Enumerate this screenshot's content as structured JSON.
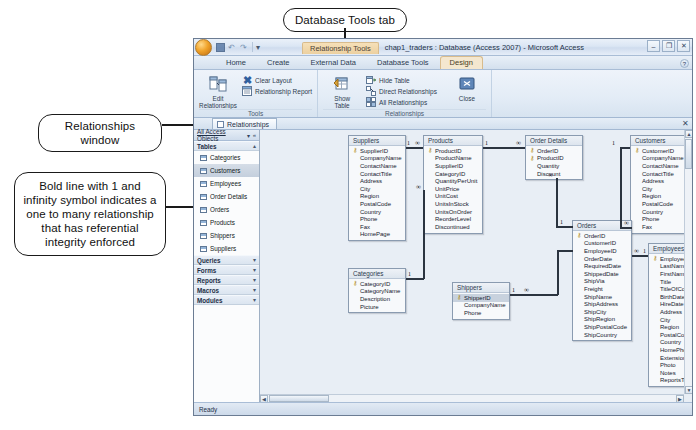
{
  "annotations": [
    {
      "id": "tab-callout",
      "text": "Database Tools tab"
    },
    {
      "id": "window-callout",
      "text": "Relationships window"
    },
    {
      "id": "boldline-callout",
      "text": "Bold line with 1 and infinity symbol indicates a one to many relationship that has referential integrity enforced"
    }
  ],
  "window": {
    "context_tools_label": "Relationship Tools",
    "document_title": "chap1_traders : Database (Access 2007) - Microsoft Access",
    "quick_access": {
      "save_icon": "save-icon",
      "undo_icon": "undo-icon",
      "redo_icon": "redo-icon",
      "customize_icon": "chevron-down-icon"
    },
    "controls": {
      "minimize": "–",
      "restore": "❐",
      "close": "✕"
    },
    "help_icon": "help-icon"
  },
  "ribbon": {
    "tabs": [
      {
        "label": "Home",
        "active": false,
        "contextual": false
      },
      {
        "label": "Create",
        "active": false,
        "contextual": false
      },
      {
        "label": "External Data",
        "active": false,
        "contextual": false
      },
      {
        "label": "Database Tools",
        "active": false,
        "contextual": false
      },
      {
        "label": "Design",
        "active": true,
        "contextual": true
      }
    ],
    "groups": [
      {
        "name": "Tools",
        "big_buttons": [
          {
            "label": "Edit\nRelationships",
            "icon": "edit-relationships-icon"
          }
        ],
        "small_buttons": [
          {
            "label": "Clear Layout",
            "icon": "clear-layout-icon"
          },
          {
            "label": "Relationship Report",
            "icon": "relationship-report-icon"
          }
        ]
      },
      {
        "name": "Relationships",
        "big_buttons": [
          {
            "label": "Show\nTable",
            "icon": "show-table-icon"
          }
        ],
        "small_buttons": [
          {
            "label": "Hide Table",
            "icon": "hide-table-icon"
          },
          {
            "label": "Direct Relationships",
            "icon": "direct-relationships-icon"
          },
          {
            "label": "All Relationships",
            "icon": "all-relationships-icon"
          }
        ],
        "close_button": {
          "label": "Close",
          "icon": "close-relationships-icon"
        }
      }
    ]
  },
  "document_tab": {
    "label": "Relationships",
    "icon": "relationships-tab-icon",
    "close_icon": "close-icon"
  },
  "nav_pane": {
    "header": {
      "title": "All Access Objects",
      "dropdown_icon": "chevron-down-icon",
      "shutter_icon": "shutter-bar-icon"
    },
    "groups": [
      {
        "label": "Tables",
        "collapse_icon": "chevron-up-icon",
        "items": [
          {
            "label": "Categories",
            "selected": false
          },
          {
            "label": "Customers",
            "selected": true
          },
          {
            "label": "Employees",
            "selected": false
          },
          {
            "label": "Order Details",
            "selected": false
          },
          {
            "label": "Orders",
            "selected": false
          },
          {
            "label": "Products",
            "selected": false
          },
          {
            "label": "Shippers",
            "selected": false
          },
          {
            "label": "Suppliers",
            "selected": false
          }
        ]
      },
      {
        "label": "Queries",
        "collapse_icon": "chevron-down-icon",
        "items": []
      },
      {
        "label": "Forms",
        "collapse_icon": "chevron-down-icon",
        "items": []
      },
      {
        "label": "Reports",
        "collapse_icon": "chevron-down-icon",
        "items": []
      },
      {
        "label": "Macros",
        "collapse_icon": "chevron-down-icon",
        "items": []
      },
      {
        "label": "Modules",
        "collapse_icon": "chevron-down-icon",
        "items": []
      }
    ]
  },
  "relationships": {
    "tables": [
      {
        "name": "Suppliers",
        "x": 88,
        "y": 5,
        "w": 58,
        "fields": [
          {
            "name": "SupplierID",
            "key": true
          },
          {
            "name": "CompanyName",
            "key": false
          },
          {
            "name": "ContactName",
            "key": false
          },
          {
            "name": "ContactTitle",
            "key": false
          },
          {
            "name": "Address",
            "key": false
          },
          {
            "name": "City",
            "key": false
          },
          {
            "name": "Region",
            "key": false
          },
          {
            "name": "PostalCode",
            "key": false
          },
          {
            "name": "Country",
            "key": false
          },
          {
            "name": "Phone",
            "key": false
          },
          {
            "name": "Fax",
            "key": false
          },
          {
            "name": "HomePage",
            "key": false
          }
        ]
      },
      {
        "name": "Products",
        "x": 163,
        "y": 5,
        "w": 60,
        "fields": [
          {
            "name": "ProductID",
            "key": true
          },
          {
            "name": "ProductName",
            "key": false
          },
          {
            "name": "SupplierID",
            "key": false
          },
          {
            "name": "CategoryID",
            "key": false
          },
          {
            "name": "QuantityPerUnit",
            "key": false
          },
          {
            "name": "UnitPrice",
            "key": false
          },
          {
            "name": "UnitCost",
            "key": false
          },
          {
            "name": "UnitsInStock",
            "key": false
          },
          {
            "name": "UnitsOnOrder",
            "key": false
          },
          {
            "name": "ReorderLevel",
            "key": false
          },
          {
            "name": "Discontinued",
            "key": false
          }
        ]
      },
      {
        "name": "Order Details",
        "x": 265,
        "y": 5,
        "w": 58,
        "fields": [
          {
            "name": "OrderID",
            "key": true
          },
          {
            "name": "ProductID",
            "key": true
          },
          {
            "name": "Quantity",
            "key": false
          },
          {
            "name": "Discount",
            "key": false
          }
        ]
      },
      {
        "name": "Customers",
        "x": 370,
        "y": 5,
        "w": 58,
        "fields": [
          {
            "name": "CustomerID",
            "key": true
          },
          {
            "name": "CompanyName",
            "key": false
          },
          {
            "name": "ContactName",
            "key": false
          },
          {
            "name": "ContactTitle",
            "key": false
          },
          {
            "name": "Address",
            "key": false
          },
          {
            "name": "City",
            "key": false
          },
          {
            "name": "Region",
            "key": false
          },
          {
            "name": "PostalCode",
            "key": false
          },
          {
            "name": "Country",
            "key": false
          },
          {
            "name": "Phone",
            "key": false
          },
          {
            "name": "Fax",
            "key": false
          }
        ]
      },
      {
        "name": "Categories",
        "x": 88,
        "y": 138,
        "w": 58,
        "fields": [
          {
            "name": "CategoryID",
            "key": true
          },
          {
            "name": "CategoryName",
            "key": false
          },
          {
            "name": "Description",
            "key": false
          },
          {
            "name": "Picture",
            "key": false
          }
        ]
      },
      {
        "name": "Shippers",
        "x": 192,
        "y": 152,
        "w": 58,
        "fields": [
          {
            "name": "ShipperID",
            "key": true,
            "selected": true
          },
          {
            "name": "CompanyName",
            "key": false
          },
          {
            "name": "Phone",
            "key": false
          }
        ]
      },
      {
        "name": "Orders",
        "x": 312,
        "y": 90,
        "w": 60,
        "fields": [
          {
            "name": "OrderID",
            "key": true
          },
          {
            "name": "CustomerID",
            "key": false
          },
          {
            "name": "EmployeeID",
            "key": false
          },
          {
            "name": "OrderDate",
            "key": false
          },
          {
            "name": "RequiredDate",
            "key": false
          },
          {
            "name": "ShippedDate",
            "key": false
          },
          {
            "name": "ShipVia",
            "key": false
          },
          {
            "name": "Freight",
            "key": false
          },
          {
            "name": "ShipName",
            "key": false
          },
          {
            "name": "ShipAddress",
            "key": false
          },
          {
            "name": "ShipCity",
            "key": false
          },
          {
            "name": "ShipRegion",
            "key": false
          },
          {
            "name": "ShipPostalCode",
            "key": false
          },
          {
            "name": "ShipCountry",
            "key": false
          }
        ]
      },
      {
        "name": "Employees",
        "x": 388,
        "y": 113,
        "w": 58,
        "fields": [
          {
            "name": "EmployeeID",
            "key": true
          },
          {
            "name": "LastName",
            "key": false
          },
          {
            "name": "FirstName",
            "key": false
          },
          {
            "name": "Title",
            "key": false
          },
          {
            "name": "TitleOfCourtesy",
            "key": false
          },
          {
            "name": "BirthDate",
            "key": false
          },
          {
            "name": "HireDate",
            "key": false
          },
          {
            "name": "Address",
            "key": false
          },
          {
            "name": "City",
            "key": false
          },
          {
            "name": "Region",
            "key": false
          },
          {
            "name": "PostalCode",
            "key": false
          },
          {
            "name": "Country",
            "key": false
          },
          {
            "name": "HomePhone",
            "key": false
          },
          {
            "name": "Extension",
            "key": false
          },
          {
            "name": "Photo",
            "key": false
          },
          {
            "name": "Notes",
            "key": false
          },
          {
            "name": "ReportsTo",
            "key": false
          }
        ]
      }
    ],
    "join_marks": {
      "one": "1",
      "many": "∞"
    }
  },
  "status_bar": {
    "text": "Ready"
  }
}
